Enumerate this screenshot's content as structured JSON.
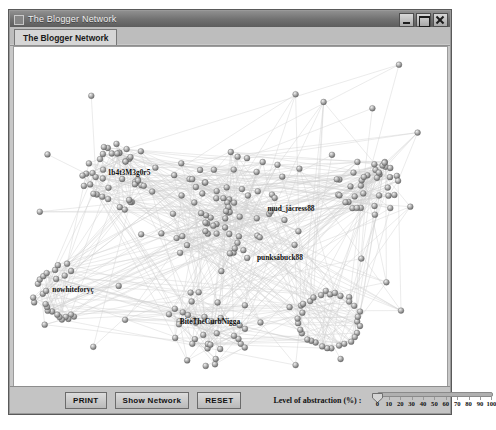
{
  "window": {
    "title": "The Blogger Network",
    "icon": "application-icon",
    "controls": [
      {
        "name": "minimize-button",
        "glyph": "minimize"
      },
      {
        "name": "maximize-button",
        "glyph": "maximize"
      },
      {
        "name": "close-button",
        "glyph": "close"
      }
    ]
  },
  "tabs": [
    {
      "label": "The Blogger Network",
      "selected": true
    }
  ],
  "toolbar": {
    "print_label": "PRINT",
    "show_network_label": "Show Network",
    "reset_label": "RESET",
    "abstraction_label": "Level of abstraction (%) :",
    "slider": {
      "value": 0,
      "min": 0,
      "max": 100,
      "step": 10,
      "tick_labels": [
        "0",
        "10",
        "20",
        "30",
        "40",
        "50",
        "60",
        "70",
        "80",
        "90",
        "100"
      ]
    }
  },
  "graph": {
    "background_color": "#ffffff",
    "node_color": "#9a9a9a",
    "edge_color": "#cfcfcf",
    "node_count": 268,
    "labels": [
      {
        "name": "node-label-1b4t3m3g0r5",
        "text": "1b4t3M3g0r5",
        "x": 115,
        "y": 128
      },
      {
        "name": "node-label-mud-jackress88",
        "text": "mud_jácress88",
        "x": 277,
        "y": 164
      },
      {
        "name": "node-label-punksbuck88",
        "text": "punksábuck88",
        "x": 266,
        "y": 213
      },
      {
        "name": "node-label-nowhitefory",
        "text": "nowhiteforyç",
        "x": 59,
        "y": 245
      },
      {
        "name": "node-label-bitethecurbnigga",
        "text": "BiteTheCurbNigga",
        "x": 196,
        "y": 277
      }
    ],
    "clusters": [
      {
        "name": "cluster-upper-left",
        "cx": 105,
        "cy": 130,
        "r": 38,
        "n": 44,
        "style": "blob"
      },
      {
        "name": "cluster-center",
        "cx": 215,
        "cy": 160,
        "r": 72,
        "n": 70,
        "style": "scatter"
      },
      {
        "name": "cluster-right",
        "cx": 355,
        "cy": 140,
        "r": 34,
        "n": 38,
        "style": "blob"
      },
      {
        "name": "cluster-lower-right",
        "cx": 315,
        "cy": 273,
        "r": 30,
        "n": 32,
        "style": "ring"
      },
      {
        "name": "cluster-lower-left",
        "cx": 55,
        "cy": 250,
        "r": 32,
        "n": 26,
        "style": "fan"
      },
      {
        "name": "cluster-lower-center",
        "cx": 185,
        "cy": 285,
        "r": 46,
        "n": 34,
        "style": "scatter"
      }
    ]
  }
}
